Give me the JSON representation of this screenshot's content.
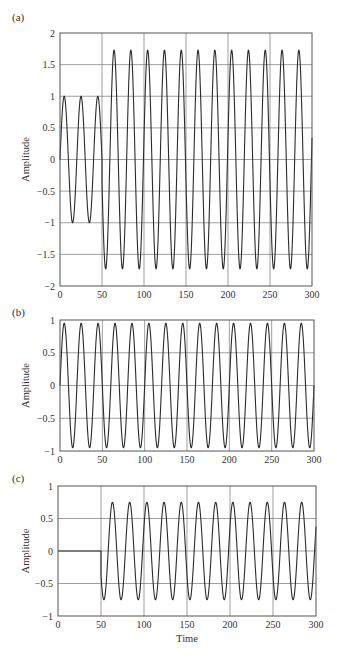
{
  "figure": {
    "width": 337,
    "height": 663,
    "line_color": "#2b2b2b",
    "grid_color": "#777777",
    "frame_color": "#555555"
  },
  "chart_data": [
    {
      "id": "a",
      "panel_label": "(a)",
      "type": "line",
      "title": "",
      "xlabel": "",
      "ylabel": "Amplitude",
      "xlim": [
        0,
        300
      ],
      "ylim": [
        -2,
        2
      ],
      "xticks": [
        0,
        50,
        100,
        150,
        200,
        250,
        300
      ],
      "xtick_labels": [
        "0",
        "50",
        "100",
        "150",
        "200",
        "250",
        "300"
      ],
      "yticks": [
        -2,
        -1.5,
        -1,
        -0.5,
        0,
        0.5,
        1,
        1.5,
        2
      ],
      "ytick_labels": [
        "−2",
        "−1.5",
        "−1",
        "−0.5",
        "0",
        "0.5",
        "1",
        "1.5",
        "2"
      ],
      "grid": true,
      "frame": {
        "left": 60,
        "top": 33,
        "right": 312,
        "bottom": 286
      },
      "label_pos": {
        "x": 12,
        "y": 21
      },
      "series": [
        {
          "name": "sum",
          "description": "sin(2πt/20) for t<50; amplitude ~1.73 sinusoid (sum of (b) and (c)) for t≥50",
          "segments": [
            {
              "t_start": 0,
              "t_end": 50,
              "amplitude": 1.0,
              "period": 20,
              "phase": 0
            },
            {
              "t_start": 50,
              "t_end": 300,
              "amplitude": 1.73,
              "period": 20,
              "phase": 0.2
            }
          ],
          "peaks_approx": 1.73,
          "troughs_approx": -1.73
        }
      ]
    },
    {
      "id": "b",
      "panel_label": "(b)",
      "type": "line",
      "title": "",
      "xlabel": "",
      "ylabel": "Amplitude",
      "xlim": [
        0,
        300
      ],
      "ylim": [
        -1,
        1
      ],
      "xticks": [
        0,
        50,
        100,
        150,
        200,
        250,
        300
      ],
      "xtick_labels": [
        "0",
        "50",
        "100",
        "150",
        "200",
        "250",
        "300"
      ],
      "yticks": [
        -1,
        -0.5,
        0,
        0.5,
        1
      ],
      "ytick_labels": [
        "−1",
        "−0.5",
        "0",
        "0.5",
        "1"
      ],
      "grid": true,
      "frame": {
        "left": 60,
        "top": 320,
        "right": 314,
        "bottom": 451
      },
      "label_pos": {
        "x": 12,
        "y": 316
      },
      "series": [
        {
          "name": "sinusoid",
          "segments": [
            {
              "t_start": 0,
              "t_end": 300,
              "amplitude": 0.95,
              "period": 20,
              "phase": 0
            }
          ],
          "peaks_approx": 0.95,
          "troughs_approx": -0.95
        }
      ]
    },
    {
      "id": "c",
      "panel_label": "(c)",
      "type": "line",
      "title": "",
      "xlabel": "Time",
      "ylabel": "Amplitude",
      "xlim": [
        0,
        300
      ],
      "ylim": [
        -1,
        1
      ],
      "xticks": [
        0,
        50,
        100,
        150,
        200,
        250,
        300
      ],
      "xtick_labels": [
        "0",
        "50",
        "100",
        "150",
        "200",
        "250",
        "300"
      ],
      "yticks": [
        -1,
        -0.5,
        0,
        0.5,
        1
      ],
      "ytick_labels": [
        "−1",
        "−0.5",
        "0",
        "0.5",
        "1"
      ],
      "grid": true,
      "frame": {
        "left": 58,
        "top": 486,
        "right": 316,
        "bottom": 616
      },
      "label_pos": {
        "x": 12,
        "y": 482
      },
      "series": [
        {
          "name": "delayed sinusoid",
          "description": "zero for t<50, then 0.75 amplitude sinusoid starting at ~0.37",
          "segments": [
            {
              "t_start": 0,
              "t_end": 50,
              "amplitude": 0,
              "period": 20,
              "phase": 0
            },
            {
              "t_start": 50,
              "t_end": 300,
              "amplitude": 0.75,
              "period": 20,
              "phase": 0.52
            }
          ],
          "peaks_approx": 0.75,
          "troughs_approx": -0.75
        }
      ]
    }
  ]
}
